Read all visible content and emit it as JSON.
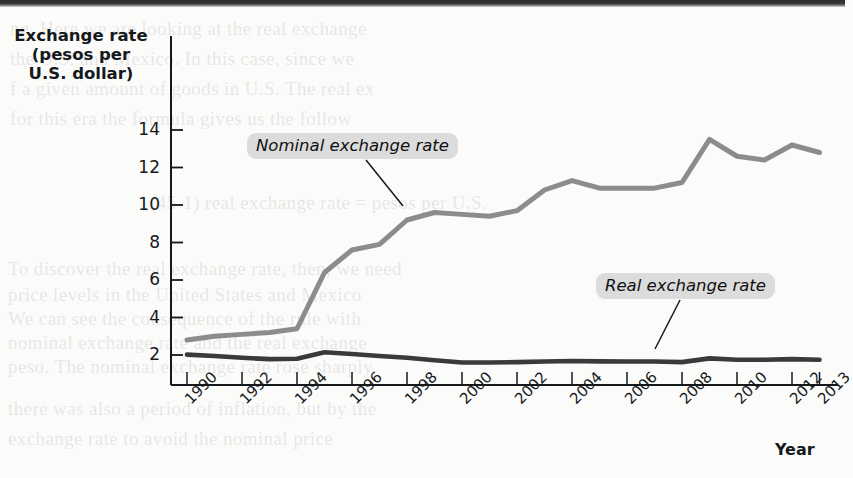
{
  "chart_data": {
    "type": "line",
    "title": "",
    "ylabel": "Exchange rate (pesos per U.S. dollar)",
    "ylabel_lines": [
      "Exchange rate",
      "(pesos per",
      "U.S. dollar)"
    ],
    "xlabel": "Year",
    "ylim": [
      0,
      15
    ],
    "yticks": [
      2,
      4,
      6,
      8,
      10,
      12,
      14
    ],
    "ytick_labels": [
      "2",
      "4",
      "6",
      "8",
      "10",
      "12",
      "14"
    ],
    "xlim": [
      1990,
      2013
    ],
    "xticks": [
      1990,
      1992,
      1994,
      1996,
      1998,
      2000,
      2002,
      2004,
      2006,
      2008,
      2010,
      2012,
      2013
    ],
    "xtick_labels": [
      "1990",
      "1992",
      "1994",
      "1996",
      "1998",
      "2000",
      "2002",
      "2004",
      "2006",
      "2008",
      "2010",
      "2012",
      "2013"
    ],
    "grid": false,
    "legend_position": "inline-annotation",
    "x": [
      1990,
      1991,
      1992,
      1993,
      1994,
      1995,
      1996,
      1997,
      1998,
      1999,
      2000,
      2001,
      2002,
      2003,
      2004,
      2005,
      2006,
      2007,
      2008,
      2009,
      2010,
      2011,
      2012,
      2013
    ],
    "series": [
      {
        "name": "Nominal exchange rate",
        "color": "#8c8c8c",
        "values": [
          2.8,
          3.0,
          3.1,
          3.2,
          3.4,
          6.4,
          7.6,
          7.9,
          9.2,
          9.6,
          9.5,
          9.4,
          9.7,
          10.8,
          11.3,
          10.9,
          10.9,
          10.9,
          11.2,
          13.5,
          12.6,
          12.4,
          13.2,
          12.8
        ]
      },
      {
        "name": "Real exchange rate",
        "color": "#3a3a3a",
        "values": [
          2.02,
          1.95,
          1.85,
          1.78,
          1.8,
          2.15,
          2.05,
          1.95,
          1.85,
          1.72,
          1.6,
          1.6,
          1.62,
          1.65,
          1.68,
          1.66,
          1.65,
          1.65,
          1.62,
          1.82,
          1.75,
          1.75,
          1.78,
          1.75
        ]
      }
    ],
    "annotations": [
      {
        "text": "Nominal exchange rate",
        "label_x": 247,
        "label_y": 133,
        "leader_from_x": 366,
        "leader_from_y": 160,
        "leader_to_x": 403,
        "leader_to_y": 206
      },
      {
        "text": "Real exchange rate",
        "label_x": 596,
        "label_y": 273,
        "leader_from_x": 680,
        "leader_from_y": 300,
        "leader_to_x": 655,
        "leader_to_y": 349
      }
    ]
  },
  "background_bleed": [
    {
      "text": "ng. Here we are looking at the real exchange",
      "x": 10,
      "y": 18
    },
    {
      "text": "the U.S. and Mexico. In this case, since we",
      "x": 10,
      "y": 48
    },
    {
      "text": "f a given amount of goods in U.S. The real ex",
      "x": 10,
      "y": 78
    },
    {
      "text": "for this era the formula gives us the follow",
      "x": 10,
      "y": 108
    },
    {
      "text": "(45-1) real exchange rate = pesos per U.S.",
      "x": 150,
      "y": 192
    },
    {
      "text": "To discover the real exchange rate, then, we need",
      "x": 8,
      "y": 258
    },
    {
      "text": "price levels in the United States and Mexico",
      "x": 8,
      "y": 284
    },
    {
      "text": "We can see the consequence of the rule with",
      "x": 8,
      "y": 308
    },
    {
      "text": "nominal exchange rate and the real exchange",
      "x": 8,
      "y": 332
    },
    {
      "text": "peso. The nominal exchange rate rose sharply",
      "x": 8,
      "y": 356
    },
    {
      "text": "there was also a period of inflation, but by the",
      "x": 8,
      "y": 398
    },
    {
      "text": "exchange rate to avoid the nominal price",
      "x": 8,
      "y": 428
    }
  ]
}
